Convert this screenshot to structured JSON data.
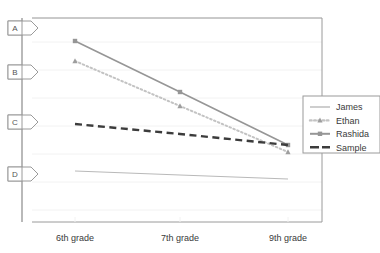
{
  "chart_data": {
    "type": "line",
    "title": "",
    "subtitle": "",
    "xlabel": "",
    "ylabel": "",
    "grid": true,
    "legend_position": "right",
    "categories": [
      "6th grade",
      "7th grade",
      "9th grade"
    ],
    "x_positions": [
      75,
      180,
      288
    ],
    "ylim": [
      0,
      100
    ],
    "y_gridlines": [
      18,
      42,
      70,
      98,
      126,
      154,
      182,
      210
    ],
    "series": [
      {
        "name": "James",
        "values": [
          28,
          26,
          24
        ],
        "pixel_y": [
          171,
          175,
          179
        ],
        "color": "#b9b9b9",
        "style": "solid",
        "marker": "none",
        "width": 1
      },
      {
        "name": "Ethan",
        "values": [
          74,
          52,
          32
        ],
        "pixel_y": [
          61,
          106,
          152
        ],
        "color": "#c3c3c3",
        "style": "dotted",
        "marker": "triangle",
        "width": 2
      },
      {
        "name": "Rashida",
        "values": [
          83,
          61,
          35
        ],
        "pixel_y": [
          41,
          92,
          145
        ],
        "color": "#969696",
        "style": "solid",
        "marker": "square",
        "width": 1.6
      },
      {
        "name": "Sample",
        "values": [
          57,
          49,
          41
        ],
        "pixel_y": [
          124,
          134,
          145
        ],
        "color": "#3c3c3c",
        "style": "dashed",
        "marker": "none",
        "width": 2.4
      }
    ],
    "axis_markers": [
      {
        "label": "A",
        "pixel_y": 28
      },
      {
        "label": "B",
        "pixel_y": 72
      },
      {
        "label": "C",
        "pixel_y": 122
      },
      {
        "label": "D",
        "pixel_y": 174
      }
    ],
    "annotations": []
  },
  "legend": {
    "items": [
      {
        "label": "James"
      },
      {
        "label": "Ethan"
      },
      {
        "label": "Rashida"
      },
      {
        "label": "Sample"
      }
    ]
  },
  "axis": {
    "x_tick_labels": [
      "6th grade",
      "7th grade",
      "9th grade"
    ],
    "y_marker_labels": [
      "A",
      "B",
      "C",
      "D"
    ]
  },
  "colors": {
    "plot_border": "#9a9a9a",
    "gridline": "#f2f2f2",
    "axis_spine": "#8a8a8a",
    "marker_box_border": "#9a9a9a",
    "legend_border": "#9a9a9a",
    "background": "#ffffff",
    "text": "#3a3a3a"
  }
}
